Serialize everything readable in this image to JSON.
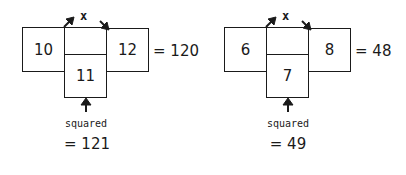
{
  "diagrams": [
    {
      "multiply_label": "x",
      "left_value": "10",
      "middle_value": "11",
      "right_value": "12",
      "product_result": "= 120",
      "squared_label": "squared",
      "squared_result": "= 121"
    },
    {
      "multiply_label": "x",
      "left_value": "6",
      "middle_value": "7",
      "right_value": "8",
      "product_result": "= 48",
      "squared_label": "squared",
      "squared_result": "= 49"
    }
  ],
  "colors": {
    "stroke": "#1a1a1a",
    "background": "#ffffff"
  }
}
